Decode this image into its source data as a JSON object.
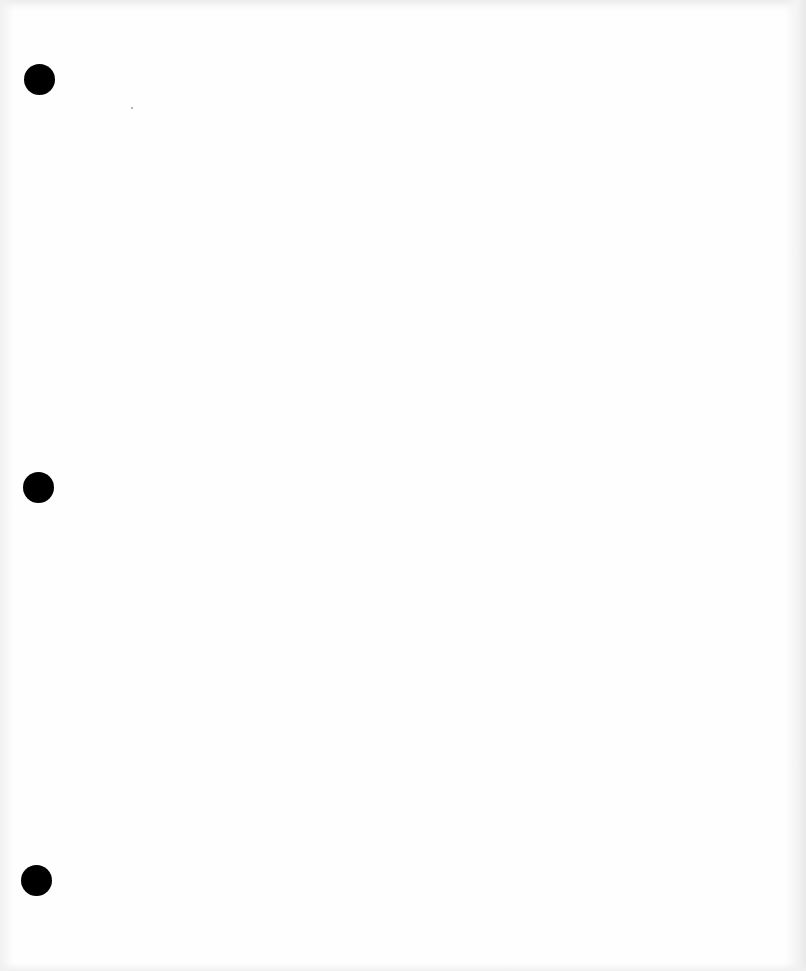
{
  "page": {
    "type": "blank-scanned-sheet",
    "background_color": "#fefefe",
    "text_content": ""
  },
  "punch_holes": [
    {
      "label": "top",
      "cx": 39,
      "cy": 79,
      "diameter": 31,
      "color": "#000000"
    },
    {
      "label": "middle",
      "cx": 38,
      "cy": 487,
      "diameter": 31,
      "color": "#000000"
    },
    {
      "label": "bottom",
      "cx": 36,
      "cy": 880,
      "diameter": 31,
      "color": "#000000"
    }
  ],
  "artifacts": [
    {
      "label": "speck",
      "x": 131,
      "y": 107
    }
  ]
}
